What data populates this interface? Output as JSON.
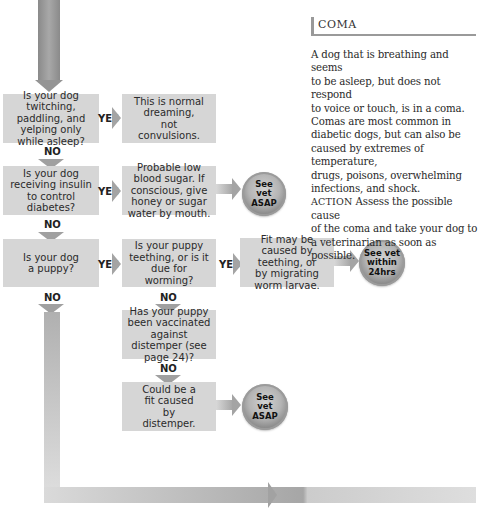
{
  "flowchart": {
    "questions": [
      {
        "id": "q1",
        "text": "Is your dog twitching, paddling, and yelping only while asleep?"
      },
      {
        "id": "q2",
        "text": "Is your dog receiving insulin to control diabetes?"
      },
      {
        "id": "q3",
        "text": "Is your dog a puppy?"
      },
      {
        "id": "q4",
        "text": "Is your puppy teething, or is it due for worming?"
      },
      {
        "id": "q5",
        "text": "Has your puppy been vaccinated against distemper (see page 24)?"
      }
    ],
    "outcomes": [
      {
        "id": "o1",
        "text": "This is normal dreaming, not convulsions."
      },
      {
        "id": "o2",
        "text": "Probable low blood sugar. If conscious, give honey or sugar water by mouth."
      },
      {
        "id": "o3",
        "text": "Fit may be caused by teething, or by migrating worm larvae."
      },
      {
        "id": "o4",
        "text": "Could be a fit caused by distemper."
      }
    ],
    "badges": [
      {
        "id": "b1",
        "text": "See vet ASAP"
      },
      {
        "id": "b2",
        "text": "See vet within 24hrs"
      },
      {
        "id": "b3",
        "text": "See vet ASAP"
      }
    ],
    "labels": {
      "yes": "YES",
      "no": "NO"
    }
  },
  "coma": {
    "title": "COMA",
    "body": "A dog that is breathing and seems\nto be asleep, but does not respond\nto voice or touch, is in a coma.\nComas are most common in\ndiabetic dogs, but can also be\ncaused by extremes of temperature,\ndrugs, poisons, overwhelming\ninfections, and shock.",
    "action_label": "ACTION",
    "action_text": " Assess the possible cause\nof the coma and take your dog to\na veterinarian as soon as possible."
  }
}
